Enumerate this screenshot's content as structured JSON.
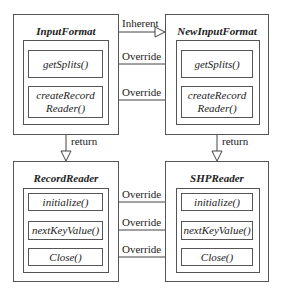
{
  "classes": {
    "input_format": {
      "title": "InputFormat",
      "methods": [
        "getSplits()",
        "createRecord\nReader()"
      ]
    },
    "new_input_format": {
      "title": "NewInputFormat",
      "methods": [
        "getSplits()",
        "createRecord\nReader()"
      ]
    },
    "record_reader": {
      "title": "RecordReader",
      "methods": [
        "initialize()",
        "nextKeyValue()",
        "Close()"
      ]
    },
    "shp_reader": {
      "title": "SHPReader",
      "methods": [
        "initialize()",
        "nextKeyValue()",
        "Close()"
      ]
    }
  },
  "edges": {
    "inherent": "Inherent",
    "override_1": "Override",
    "override_2": "Override",
    "override_3": "Override",
    "override_4": "Override",
    "override_5": "Override",
    "return_left": "return",
    "return_right": "return"
  },
  "colors": {
    "line": "#555555",
    "text": "#222222",
    "background": "#ffffff"
  }
}
